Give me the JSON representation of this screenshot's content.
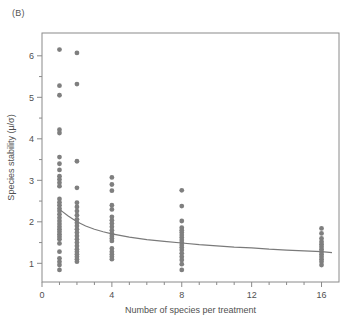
{
  "figure": {
    "panel_label": "(B)",
    "point_color": "#7f7f7f",
    "line_color": "#7a7a7a",
    "frame_color": "#8a8a8a",
    "background": "#ffffff"
  },
  "chart_data": {
    "type": "scatter",
    "title": "",
    "xlabel": "Number of species per treatment",
    "ylabel": "Species stability (μ/σ)",
    "xlim": [
      0,
      17
    ],
    "ylim": [
      0.55,
      6.55
    ],
    "xticks": [
      0,
      4,
      8,
      12,
      16
    ],
    "xtick_labels": [
      "0",
      "4",
      "8",
      "12",
      "16"
    ],
    "xminor_ticks": [
      1,
      2,
      3,
      5,
      6,
      7,
      9,
      10,
      11,
      13,
      14,
      15
    ],
    "yticks": [
      1,
      2,
      3,
      4,
      5,
      6
    ],
    "ytick_labels": [
      "1",
      "2",
      "3",
      "4",
      "5",
      "6"
    ],
    "yminor_ticks": [
      1.5,
      2.5,
      3.5,
      4.5,
      5.5
    ],
    "grid": false,
    "legend": null,
    "series": [
      {
        "name": "Species stability observations",
        "marker": "filled-circle",
        "color": "#7f7f7f",
        "points": [
          {
            "x": 1,
            "y": 6.15
          },
          {
            "x": 1,
            "y": 5.28
          },
          {
            "x": 1,
            "y": 5.05
          },
          {
            "x": 1,
            "y": 4.22
          },
          {
            "x": 1,
            "y": 4.14
          },
          {
            "x": 1,
            "y": 3.56
          },
          {
            "x": 1,
            "y": 3.4
          },
          {
            "x": 1,
            "y": 3.25
          },
          {
            "x": 1,
            "y": 3.1
          },
          {
            "x": 1,
            "y": 3.02
          },
          {
            "x": 1,
            "y": 2.94
          },
          {
            "x": 1,
            "y": 2.86
          },
          {
            "x": 1,
            "y": 2.55
          },
          {
            "x": 1,
            "y": 2.47
          },
          {
            "x": 1,
            "y": 2.4
          },
          {
            "x": 1,
            "y": 2.32
          },
          {
            "x": 1,
            "y": 2.26
          },
          {
            "x": 1,
            "y": 2.18
          },
          {
            "x": 1,
            "y": 2.1
          },
          {
            "x": 1,
            "y": 2.02
          },
          {
            "x": 1,
            "y": 1.95
          },
          {
            "x": 1,
            "y": 1.88
          },
          {
            "x": 1,
            "y": 1.82
          },
          {
            "x": 1,
            "y": 1.76
          },
          {
            "x": 1,
            "y": 1.7
          },
          {
            "x": 1,
            "y": 1.64
          },
          {
            "x": 1,
            "y": 1.58
          },
          {
            "x": 1,
            "y": 1.48
          },
          {
            "x": 1,
            "y": 1.28
          },
          {
            "x": 1,
            "y": 1.12
          },
          {
            "x": 1,
            "y": 1.04
          },
          {
            "x": 1,
            "y": 0.96
          },
          {
            "x": 1,
            "y": 0.84
          },
          {
            "x": 2,
            "y": 6.07
          },
          {
            "x": 2,
            "y": 5.32
          },
          {
            "x": 2,
            "y": 3.46
          },
          {
            "x": 2,
            "y": 2.82
          },
          {
            "x": 2,
            "y": 2.46
          },
          {
            "x": 2,
            "y": 2.36
          },
          {
            "x": 2,
            "y": 2.26
          },
          {
            "x": 2,
            "y": 2.16
          },
          {
            "x": 2,
            "y": 2.06
          },
          {
            "x": 2,
            "y": 1.98
          },
          {
            "x": 2,
            "y": 1.9
          },
          {
            "x": 2,
            "y": 1.82
          },
          {
            "x": 2,
            "y": 1.74
          },
          {
            "x": 2,
            "y": 1.66
          },
          {
            "x": 2,
            "y": 1.58
          },
          {
            "x": 2,
            "y": 1.5
          },
          {
            "x": 2,
            "y": 1.42
          },
          {
            "x": 2,
            "y": 1.34
          },
          {
            "x": 2,
            "y": 1.28
          },
          {
            "x": 2,
            "y": 1.22
          },
          {
            "x": 2,
            "y": 1.16
          },
          {
            "x": 2,
            "y": 1.1
          },
          {
            "x": 2,
            "y": 1.04
          },
          {
            "x": 4,
            "y": 3.07
          },
          {
            "x": 4,
            "y": 2.9
          },
          {
            "x": 4,
            "y": 2.75
          },
          {
            "x": 4,
            "y": 2.4
          },
          {
            "x": 4,
            "y": 2.3
          },
          {
            "x": 4,
            "y": 2.12
          },
          {
            "x": 4,
            "y": 2.04
          },
          {
            "x": 4,
            "y": 1.96
          },
          {
            "x": 4,
            "y": 1.88
          },
          {
            "x": 4,
            "y": 1.8
          },
          {
            "x": 4,
            "y": 1.72
          },
          {
            "x": 4,
            "y": 1.66
          },
          {
            "x": 4,
            "y": 1.6
          },
          {
            "x": 4,
            "y": 1.54
          },
          {
            "x": 4,
            "y": 1.36
          },
          {
            "x": 4,
            "y": 1.28
          },
          {
            "x": 4,
            "y": 1.22
          },
          {
            "x": 4,
            "y": 1.16
          },
          {
            "x": 4,
            "y": 1.1
          },
          {
            "x": 8,
            "y": 2.76
          },
          {
            "x": 8,
            "y": 2.38
          },
          {
            "x": 8,
            "y": 2.02
          },
          {
            "x": 8,
            "y": 1.86
          },
          {
            "x": 8,
            "y": 1.8
          },
          {
            "x": 8,
            "y": 1.74
          },
          {
            "x": 8,
            "y": 1.68
          },
          {
            "x": 8,
            "y": 1.62
          },
          {
            "x": 8,
            "y": 1.56
          },
          {
            "x": 8,
            "y": 1.5
          },
          {
            "x": 8,
            "y": 1.44
          },
          {
            "x": 8,
            "y": 1.38
          },
          {
            "x": 8,
            "y": 1.32
          },
          {
            "x": 8,
            "y": 1.24
          },
          {
            "x": 8,
            "y": 1.16
          },
          {
            "x": 8,
            "y": 1.08
          },
          {
            "x": 8,
            "y": 0.98
          },
          {
            "x": 8,
            "y": 0.84
          },
          {
            "x": 16,
            "y": 1.84
          },
          {
            "x": 16,
            "y": 1.72
          },
          {
            "x": 16,
            "y": 1.6
          },
          {
            "x": 16,
            "y": 1.52
          },
          {
            "x": 16,
            "y": 1.46
          },
          {
            "x": 16,
            "y": 1.4
          },
          {
            "x": 16,
            "y": 1.34
          },
          {
            "x": 16,
            "y": 1.28
          },
          {
            "x": 16,
            "y": 1.22
          },
          {
            "x": 16,
            "y": 1.16
          },
          {
            "x": 16,
            "y": 1.1
          },
          {
            "x": 16,
            "y": 1.04
          },
          {
            "x": 16,
            "y": 0.96
          }
        ]
      }
    ],
    "fit_curve": {
      "name": "fitted decay curve",
      "color": "#7a7a7a",
      "x": [
        1,
        1.5,
        2,
        2.5,
        3,
        3.5,
        4,
        5,
        6,
        7,
        8,
        9,
        10,
        11,
        12,
        13,
        14,
        15,
        16,
        16.6
      ],
      "y": [
        2.3,
        2.14,
        2.0,
        1.9,
        1.82,
        1.76,
        1.71,
        1.63,
        1.57,
        1.53,
        1.49,
        1.45,
        1.42,
        1.39,
        1.37,
        1.34,
        1.32,
        1.3,
        1.28,
        1.26
      ]
    }
  }
}
